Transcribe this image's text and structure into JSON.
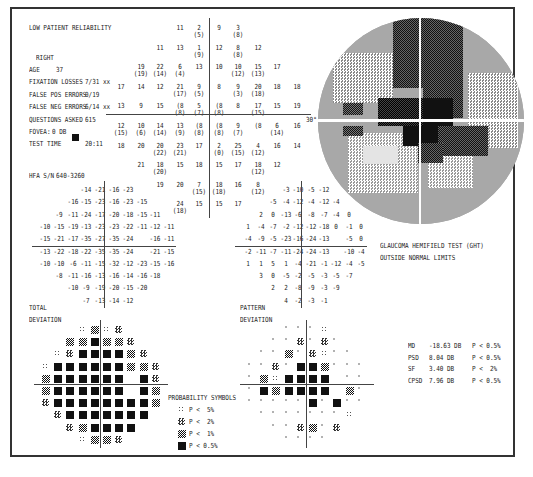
{
  "header": {
    "reliability_warning": "LOW PATIENT RELIABILITY",
    "eye": "RIGHT",
    "fields": [
      {
        "label": "AGE",
        "value": "37"
      },
      {
        "label": "FIXATION LOSSES",
        "value": "7/31 xx"
      },
      {
        "label": "FALSE POS ERRORS",
        "value": "0/19"
      },
      {
        "label": "FALSE NEG ERRORS",
        "value": "6/14 xx"
      },
      {
        "label": "QUESTIONS ASKED",
        "value": "615"
      },
      {
        "label": "FOVEA:",
        "value": "0 DB"
      },
      {
        "label": "TEST TIME",
        "value": "20:11"
      }
    ],
    "hfa_sn_label": "HFA S/N",
    "hfa_sn_value": "640-3260"
  },
  "threshold_grid": {
    "rows": [
      [
        "",
        "",
        "",
        "11",
        "2 (5)",
        "9",
        "3 (8)",
        "",
        "",
        ""
      ],
      [
        "",
        "",
        "11",
        "13",
        "1 (9)",
        "12",
        "8 (8)",
        "12",
        "",
        ""
      ],
      [
        "",
        "19 (19)",
        "22 (14)",
        "6 (4)",
        "13",
        "10",
        "10 (12)",
        "15 (13)",
        "17",
        ""
      ],
      [
        "17",
        "14",
        "12",
        "21 (17)",
        "9 (5)",
        "8",
        "9 (3)",
        "20 (18)",
        "18",
        "18"
      ],
      [
        "13",
        "9",
        "15",
        "(8 (8)",
        "5 (7)",
        "(8 (8)",
        "8",
        "17 (15)",
        "15",
        "19"
      ],
      [
        "12 (15)",
        "10 (6)",
        "14 (14)",
        "13 (9)",
        "(8 (8)",
        "(8 (8)",
        "9 (7)",
        "(8",
        "6 (14)",
        "16"
      ],
      [
        "18",
        "20",
        "20 (22)",
        "23 (21)",
        "17",
        "2 (0)",
        "25 (15)",
        "4 (12)",
        "16",
        "14"
      ],
      [
        "",
        "21",
        "18 (20)",
        "15",
        "18",
        "15",
        "17",
        "18 (12)",
        "12",
        ""
      ],
      [
        "",
        "",
        "19",
        "20",
        "7 (15)",
        "18 (18)",
        "16",
        "8 (12)",
        "",
        ""
      ],
      [
        "",
        "",
        "",
        "24 (18)",
        "15",
        "15",
        "17",
        "",
        "",
        ""
      ]
    ],
    "axis_label_30": "30°"
  },
  "total_deviation": {
    "label_line1": "TOTAL",
    "label_line2": "DEVIATION",
    "rows": [
      [
        "",
        "",
        "",
        "-14",
        "-21",
        "-16",
        "-23",
        "",
        "",
        ""
      ],
      [
        "",
        "",
        "-16",
        "-15",
        "-23",
        "-16",
        "-23",
        "-15",
        "",
        ""
      ],
      [
        "",
        "-9",
        "-11",
        "-24",
        "-17",
        "-20",
        "-18",
        "-15",
        "-11",
        ""
      ],
      [
        "-10",
        "-15",
        "-19",
        "-13",
        "-23",
        "-23",
        "-22",
        "-11",
        "-12",
        "-11"
      ],
      [
        "-15",
        "-21",
        "-17",
        "-35",
        "-27",
        "-35",
        "-24",
        "",
        "-16",
        "-11"
      ],
      [
        "-13",
        "-22",
        "-18",
        "-22",
        "-35",
        "-35",
        "-24",
        "",
        "-21",
        "-15"
      ],
      [
        "-10",
        "-10",
        "-6",
        "-11",
        "-15",
        "-32",
        "-12",
        "-23",
        "-15",
        "-16"
      ],
      [
        "",
        "-8",
        "-11",
        "-16",
        "-13",
        "-16",
        "-14",
        "-16",
        "-18",
        ""
      ],
      [
        "",
        "",
        "-10",
        "-9",
        "-19",
        "-20",
        "-15",
        "-20",
        "",
        ""
      ],
      [
        "",
        "",
        "",
        "-7",
        "-13",
        "-14",
        "-12",
        "",
        "",
        ""
      ]
    ],
    "probability_rows": [
      [
        "-",
        "-",
        "-",
        "d",
        "h",
        "d",
        "c",
        "-",
        "-",
        "-"
      ],
      [
        "-",
        "-",
        "h",
        "h",
        "b",
        "h",
        "h",
        "c",
        "-",
        "-"
      ],
      [
        "-",
        "d",
        "c",
        "b",
        "b",
        "b",
        "b",
        "h",
        "c",
        "-"
      ],
      [
        "d",
        "b",
        "b",
        "b",
        "b",
        "b",
        "b",
        "h",
        "h",
        "c"
      ],
      [
        "h",
        "b",
        "b",
        "b",
        "b",
        "b",
        "b",
        "-",
        "b",
        "c"
      ],
      [
        "h",
        "b",
        "b",
        "b",
        "b",
        "b",
        "b",
        "-",
        "b",
        "h"
      ],
      [
        "c",
        "b",
        "b",
        "b",
        "b",
        "b",
        "b",
        "b",
        "b",
        "h"
      ],
      [
        "-",
        "c",
        "b",
        "b",
        "b",
        "b",
        "b",
        "b",
        "b",
        "-"
      ],
      [
        "-",
        "-",
        "c",
        "h",
        "b",
        "b",
        "b",
        "b",
        "-",
        "-"
      ],
      [
        "-",
        "-",
        "-",
        "d",
        "h",
        "h",
        "c",
        "-",
        "-",
        "-"
      ]
    ]
  },
  "pattern_deviation": {
    "label_line1": "PATTERN",
    "label_line2": "DEVIATION",
    "rows": [
      [
        "",
        "",
        "",
        "-3",
        "-10",
        "-5",
        "-12",
        "",
        "",
        ""
      ],
      [
        "",
        "",
        "-5",
        "-4",
        "-12",
        "-4",
        "-12",
        "-4",
        "",
        ""
      ],
      [
        "",
        "2",
        "0",
        "-13",
        "-6",
        "-8",
        "-7",
        "-4",
        "0",
        ""
      ],
      [
        "1",
        "-4",
        "-7",
        "-2",
        "-12",
        "-12",
        "-18",
        "0",
        "-1",
        "0"
      ],
      [
        "-4",
        "-9",
        "-5",
        "-23",
        "-16",
        "-24",
        "-13",
        "",
        "-5",
        "0"
      ],
      [
        "-2",
        "-11",
        "-7",
        "-11",
        "-24",
        "-24",
        "-13",
        "",
        "-10",
        "-4"
      ],
      [
        "1",
        "1",
        "5",
        "1",
        "-4",
        "-21",
        "-1",
        "-12",
        "-4",
        "-5"
      ],
      [
        "",
        "3",
        "0",
        "-5",
        "-2",
        "-5",
        "-3",
        "-5",
        "-7",
        ""
      ],
      [
        "",
        "",
        "2",
        "2",
        "-8",
        "-9",
        "-3",
        "-9",
        "",
        ""
      ],
      [
        "",
        "",
        "",
        "4",
        "-2",
        "-3",
        "-1",
        "",
        "",
        ""
      ]
    ],
    "probability_rows": [
      [
        "-",
        "-",
        "-",
        "n",
        "n",
        "n",
        "d",
        "-",
        "-",
        "-"
      ],
      [
        "-",
        "-",
        "n",
        "n",
        "c",
        "n",
        "c",
        "n",
        "-",
        "-"
      ],
      [
        "-",
        "n",
        "n",
        "h",
        "n",
        "c",
        "d",
        "n",
        "n",
        "-"
      ],
      [
        "n",
        "n",
        "c",
        "n",
        "b",
        "b",
        "h",
        "n",
        "n",
        "n"
      ],
      [
        "n",
        "h",
        "d",
        "b",
        "b",
        "b",
        "b",
        "-",
        "n",
        "n"
      ],
      [
        "n",
        "b",
        "h",
        "b",
        "b",
        "b",
        "b",
        "-",
        "h",
        "n"
      ],
      [
        "n",
        "n",
        "n",
        "n",
        "n",
        "b",
        "n",
        "b",
        "n",
        "n"
      ],
      [
        "-",
        "n",
        "n",
        "n",
        "n",
        "n",
        "n",
        "n",
        "d",
        "-"
      ],
      [
        "-",
        "-",
        "n",
        "n",
        "c",
        "h",
        "n",
        "c",
        "-",
        "-"
      ],
      [
        "-",
        "-",
        "-",
        "n",
        "n",
        "n",
        "n",
        "-",
        "-",
        "-"
      ]
    ]
  },
  "ght": {
    "line1": "GLAUCOMA HEMIFIELD TEST (GHT)",
    "line2": "OUTSIDE NORMAL LIMITS"
  },
  "probability_symbols": {
    "title": "PROBABILITY SYMBOLS",
    "items": [
      {
        "symbol": "d",
        "label": "P <  5%"
      },
      {
        "symbol": "c",
        "label": "P <  2%"
      },
      {
        "symbol": "h",
        "label": "P <  1%"
      },
      {
        "symbol": "b",
        "label": "P < 0.5%"
      }
    ]
  },
  "global_indices": [
    {
      "name": "MD",
      "value": "-18.63 DB",
      "p": "P < 0.5%"
    },
    {
      "name": "PSD",
      "value": "8.04 DB",
      "p": "P < 0.5%"
    },
    {
      "name": "SF",
      "value": "3.40 DB",
      "p": "P <  2%"
    },
    {
      "name": "CPSD",
      "value": "7.96 DB",
      "p": "P < 0.5%"
    }
  ],
  "colors": {
    "ink": "#222222",
    "frame": "#333333",
    "map_light": "#d8d8d8",
    "map_mid": "#9c9c9c",
    "map_dark": "#222222"
  }
}
